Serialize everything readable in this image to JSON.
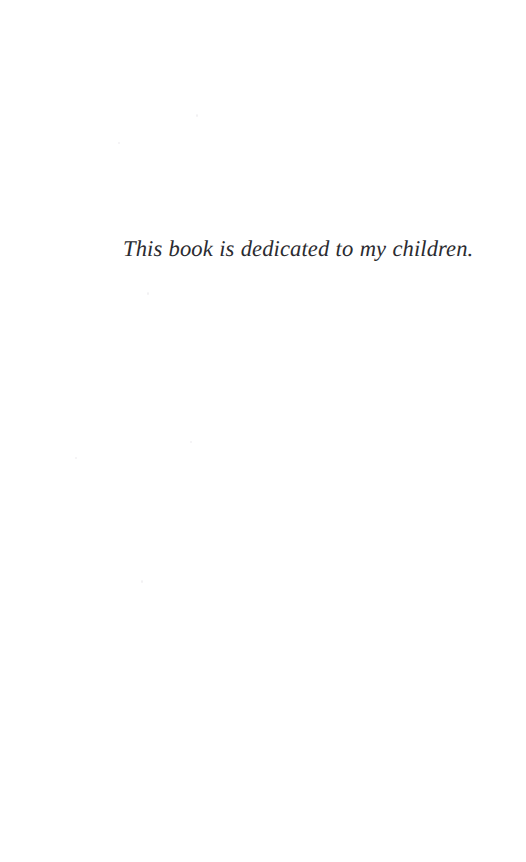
{
  "page": {
    "kind": "book-dedication-page",
    "width": 526,
    "height": 862,
    "background_color": "#ffffff",
    "text_color": "#2b2b30"
  },
  "dedication": {
    "text": "This book is dedicated to my children.",
    "style": "italic-serif",
    "alignment": "left"
  },
  "header": {
    "running_head": "",
    "page_number": ""
  },
  "footer": {
    "page_number": "",
    "note": ""
  }
}
